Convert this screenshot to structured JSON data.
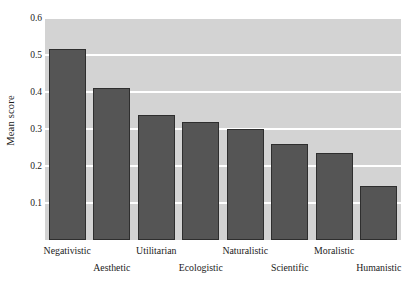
{
  "chart_data": {
    "type": "bar",
    "title": "",
    "subtitle": "",
    "xlabel": "",
    "ylabel": "Mean score",
    "categories": [
      "Negativistic",
      "Aesthetic",
      "Utilitarian",
      "Ecologistic",
      "Naturalistic",
      "Scientific",
      "Moralistic",
      "Humanistic"
    ],
    "values": [
      0.515,
      0.412,
      0.338,
      0.318,
      0.3,
      0.26,
      0.235,
      0.147
    ],
    "series": [
      {
        "name": "Mean score",
        "values": [
          0.515,
          0.412,
          0.338,
          0.318,
          0.3,
          0.26,
          0.235,
          0.147
        ]
      }
    ],
    "ylim": [
      0,
      0.6
    ],
    "y_ticks": [
      0.1,
      0.2,
      0.3,
      0.4,
      0.5,
      0.6
    ],
    "y_tick_labels": [
      "0.1",
      "0.2",
      "0.3",
      "0.4",
      "0.5",
      "0.6"
    ],
    "grid": "horizontal",
    "grid_color": "#ffffff",
    "legend": "none",
    "bar_color": "#555555",
    "bar_edge_color": "#2e2e2e",
    "plot_background": "#d3d3d3",
    "figure_background": "#ffffff",
    "label_layout": "staggered-two-rows"
  }
}
